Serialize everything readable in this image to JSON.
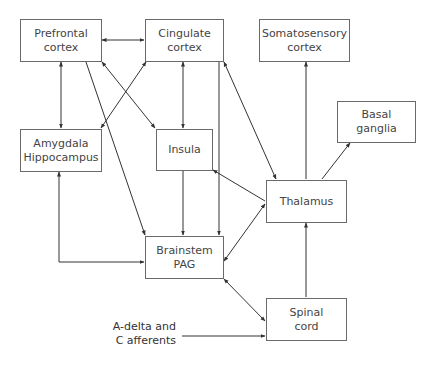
{
  "nodes": {
    "prefrontal": {
      "line1": "Prefrontal",
      "line2": "cortex"
    },
    "cingulate": {
      "line1": "Cingulate",
      "line2": "cortex"
    },
    "somatosensory": {
      "line1": "Somatosensory",
      "line2": "cortex"
    },
    "basal_ganglia": {
      "line1": "Basal",
      "line2": "ganglia"
    },
    "amygdala": {
      "line1": "Amygdala",
      "line2": "Hippocampus"
    },
    "insula": {
      "line1": "Insula"
    },
    "thalamus": {
      "line1": "Thalamus"
    },
    "brainstem": {
      "line1": "Brainstem",
      "line2": "PAG"
    },
    "spinal_cord": {
      "line1": "Spinal",
      "line2": "cord"
    }
  },
  "input_label": {
    "line1": "A-delta and",
    "line2": "C afferents"
  },
  "edges": [
    {
      "from": "Prefrontal cortex",
      "to": "Cingulate cortex",
      "direction": "both"
    },
    {
      "from": "Prefrontal cortex",
      "to": "Amygdala Hippocampus",
      "direction": "both"
    },
    {
      "from": "Prefrontal cortex",
      "to": "Insula",
      "direction": "both"
    },
    {
      "from": "Prefrontal cortex",
      "to": "Brainstem PAG",
      "direction": "forward"
    },
    {
      "from": "Amygdala Hippocampus",
      "to": "Cingulate cortex",
      "direction": "both"
    },
    {
      "from": "Cingulate cortex",
      "to": "Insula",
      "direction": "both"
    },
    {
      "from": "Cingulate cortex",
      "to": "Brainstem PAG",
      "direction": "forward"
    },
    {
      "from": "Cingulate cortex",
      "to": "Thalamus",
      "direction": "both"
    },
    {
      "from": "Insula",
      "to": "Brainstem PAG",
      "direction": "forward"
    },
    {
      "from": "Thalamus",
      "to": "Insula",
      "direction": "forward"
    },
    {
      "from": "Thalamus",
      "to": "Somatosensory cortex",
      "direction": "forward"
    },
    {
      "from": "Thalamus",
      "to": "Basal ganglia",
      "direction": "forward"
    },
    {
      "from": "Thalamus",
      "to": "Brainstem PAG",
      "direction": "both"
    },
    {
      "from": "Amygdala Hippocampus",
      "to": "Brainstem PAG",
      "direction": "both"
    },
    {
      "from": "Spinal cord",
      "to": "Thalamus",
      "direction": "forward"
    },
    {
      "from": "Spinal cord",
      "to": "Brainstem PAG",
      "direction": "both"
    },
    {
      "from": "A-delta and C afferents",
      "to": "Spinal cord",
      "direction": "forward"
    }
  ],
  "colors": {
    "line": "#333333",
    "border": "#6a6a6a",
    "text": "#444444"
  }
}
